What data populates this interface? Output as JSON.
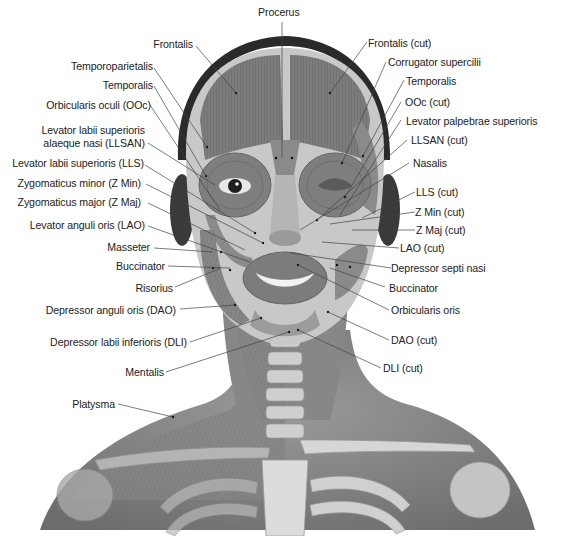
{
  "figure": {
    "colors": {
      "background": "#ffffff",
      "skin": "#8a8a8a",
      "muscle": "#7a7a7a",
      "muscle_light": "#a3a3a3",
      "bone": "#d4d4d4",
      "hair": "#2a2a2a",
      "text": "#222222",
      "leader": "#444444"
    }
  },
  "labels": {
    "top": {
      "procerus": "Procerus"
    },
    "left": [
      {
        "id": "frontalis",
        "text": "Frontalis"
      },
      {
        "id": "temporoparietalis",
        "text": "Temporoparietalis"
      },
      {
        "id": "temporalis",
        "text": "Temporalis"
      },
      {
        "id": "orbicularis-oculi",
        "text": "Orbicularis oculi (OOc)"
      },
      {
        "id": "llsan-1",
        "text": "Levator labii superioris"
      },
      {
        "id": "llsan-2",
        "text": "alaeque nasi (LLSAN)"
      },
      {
        "id": "lls",
        "text": "Levator labii superioris (LLS)"
      },
      {
        "id": "zmin",
        "text": "Zygomaticus minor (Z Min)"
      },
      {
        "id": "zmaj",
        "text": "Zygomaticus major (Z Maj)"
      },
      {
        "id": "lao",
        "text": "Levator anguli oris (LAO)"
      },
      {
        "id": "masseter",
        "text": "Masseter"
      },
      {
        "id": "buccinator",
        "text": "Buccinator"
      },
      {
        "id": "risorius",
        "text": "Risorius"
      },
      {
        "id": "dao",
        "text": "Depressor anguli oris (DAO)"
      },
      {
        "id": "dli",
        "text": "Depressor labii inferioris (DLI)"
      },
      {
        "id": "mentalis",
        "text": "Mentalis"
      },
      {
        "id": "platysma",
        "text": "Platysma"
      }
    ],
    "right": [
      {
        "id": "frontalis-cut",
        "text": "Frontalis (cut)"
      },
      {
        "id": "corrugator",
        "text": "Corrugator supercilii"
      },
      {
        "id": "temporalis-r",
        "text": "Temporalis"
      },
      {
        "id": "ooc-cut",
        "text": "OOc (cut)"
      },
      {
        "id": "lps",
        "text": "Levator palpebrae superioris"
      },
      {
        "id": "llsan-cut",
        "text": "LLSAN (cut)"
      },
      {
        "id": "nasalis",
        "text": "Nasalis"
      },
      {
        "id": "lls-cut",
        "text": "LLS (cut)"
      },
      {
        "id": "zmin-cut",
        "text": "Z Min (cut)"
      },
      {
        "id": "zmaj-cut",
        "text": "Z Maj (cut)"
      },
      {
        "id": "lao-cut",
        "text": "LAO (cut)"
      },
      {
        "id": "dsn",
        "text": "Depressor septi nasi"
      },
      {
        "id": "buccinator-r",
        "text": "Buccinator"
      },
      {
        "id": "orbicularis-oris",
        "text": "Orbicularis oris"
      },
      {
        "id": "dao-cut",
        "text": "DAO (cut)"
      },
      {
        "id": "dli-cut",
        "text": "DLI (cut)"
      }
    ]
  }
}
